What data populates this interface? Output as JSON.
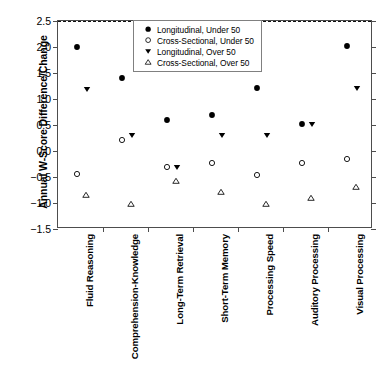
{
  "chart_data": {
    "type": "scatter",
    "title": "",
    "xlabel": "",
    "ylabel": "Annual W-Score Difference/Change",
    "ylim": [
      -1.5,
      2.5
    ],
    "yticks": [
      "2.5",
      "2.0",
      "1.5",
      "1.0",
      "0.5",
      "0.0",
      "-0.5",
      "-1.0",
      "-1.5"
    ],
    "ytick_values": [
      2.5,
      2.0,
      1.5,
      1.0,
      0.5,
      0.0,
      -0.5,
      -1.0,
      -1.5
    ],
    "grid": false,
    "legend_position": "top-center",
    "reference_line": 0.0,
    "categories": [
      "Fluid Reasoning",
      "Comprehension-Knowledge",
      "Long-Term Retrieval",
      "Short-Term Memory",
      "Processing Speed",
      "Auditory Processing",
      "Visual Processing"
    ],
    "series": [
      {
        "name": "Longitudinal, Under 50",
        "marker": "filled-circle",
        "color": "#000000",
        "values": [
          2.0,
          1.41,
          0.6,
          0.7,
          1.21,
          0.51,
          2.01
        ]
      },
      {
        "name": "Cross-Sectional, Under 50",
        "marker": "open-circle",
        "color": "#000000",
        "values": [
          -0.44,
          0.21,
          -0.3,
          -0.23,
          -0.46,
          -0.24,
          -0.15
        ]
      },
      {
        "name": "Longitudinal, Over 50",
        "marker": "filled-triangle-down",
        "color": "#000000",
        "values": [
          1.2,
          0.3,
          -0.3,
          0.3,
          0.3,
          0.51,
          1.21
        ]
      },
      {
        "name": "Cross-Sectional, Over 50",
        "marker": "open-triangle-up",
        "color": "#000000",
        "values": [
          -0.84,
          -1.02,
          -0.57,
          -0.79,
          -1.02,
          -0.9,
          -0.7
        ]
      }
    ]
  },
  "legend": {
    "entries": [
      {
        "marker": "filled-circle",
        "label": "Longitudinal, Under 50"
      },
      {
        "marker": "open-circle",
        "label": "Cross-Sectional, Under 50"
      },
      {
        "marker": "filled-triangle-down",
        "label": "Longitudinal, Over 50"
      },
      {
        "marker": "open-triangle-up",
        "label": "Cross-Sectional, Over 50"
      }
    ]
  },
  "caption": {
    "text": ""
  }
}
